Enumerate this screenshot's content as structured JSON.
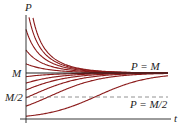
{
  "chart_data": {
    "type": "line",
    "title": "",
    "xlabel": "t",
    "ylabel": "P",
    "y_ticks": [
      "M",
      "M/2"
    ],
    "annotations": [
      "P = M",
      "P = M/2"
    ],
    "reference_lines": [
      {
        "label": "P = M",
        "value": "M",
        "style": "solid"
      },
      {
        "label": "P = M/2",
        "value": "M/2",
        "style": "dashed"
      }
    ],
    "M": 1.0,
    "series": [
      {
        "name": "P0 far above M (1)",
        "initial_value": 3.5
      },
      {
        "name": "P0 far above M (2)",
        "initial_value": 2.6
      },
      {
        "name": "P0 above M (3)",
        "initial_value": 1.95
      },
      {
        "name": "P0 above M (4)",
        "initial_value": 1.5
      },
      {
        "name": "P0 above M (5)",
        "initial_value": 1.2
      },
      {
        "name": "P0 below M (6)",
        "initial_value": 0.92
      },
      {
        "name": "P0 below M (7)",
        "initial_value": 0.78
      },
      {
        "name": "P0 below M (8)",
        "initial_value": 0.63
      },
      {
        "name": "P0 below M (9)",
        "initial_value": 0.46
      },
      {
        "name": "P0 below M (10)",
        "initial_value": 0.28
      },
      {
        "name": "P0 below M (11)",
        "initial_value": 0.06
      }
    ],
    "line_color": "#8b1a1a",
    "axis_color": "#222222"
  },
  "labels": {
    "y_axis": "P",
    "x_axis": "t",
    "tick_M": "M",
    "tick_M_half": "M/2",
    "line_M": "P = M",
    "line_M_half": "P = M/2"
  }
}
